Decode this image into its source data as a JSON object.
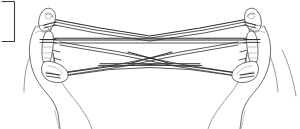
{
  "image": {
    "title": "Two hands holding a string figure",
    "subject": "string-figure-hand-illustration",
    "style": "black and white line drawing",
    "background_color": "#ffffff",
    "ink_color": "#3a3a40",
    "width": 300,
    "height": 129
  },
  "elements": {
    "left_hand_label": "left hand",
    "right_hand_label": "right hand",
    "left_thumb_label": "left thumb",
    "left_index_label": "left index finger",
    "right_thumb_label": "right thumb",
    "right_index_label": "right index finger",
    "string_loop_label": "string loop",
    "upper_band_label": "upper string band",
    "mid_band_label": "middle string band",
    "lower_band_label": "lower string band",
    "crossing_label": "central string crossing",
    "border_fragment_label": "figure border fragment"
  },
  "annotations": {
    "notes": ""
  }
}
